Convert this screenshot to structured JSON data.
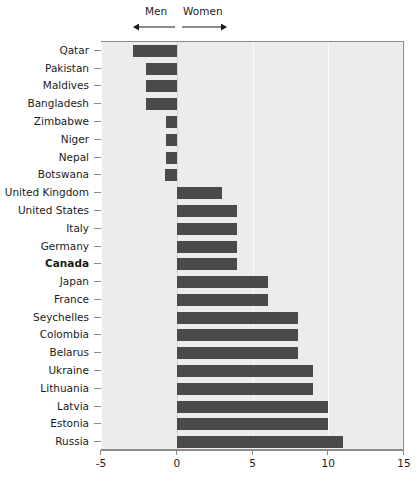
{
  "chart_data": {
    "type": "bar",
    "orientation": "horizontal",
    "title": "",
    "subtitle": "",
    "xlabel": "",
    "ylabel": "",
    "xlim": [
      -5,
      15
    ],
    "xticks": [
      -5,
      0,
      5,
      10,
      15
    ],
    "xtick_labels": [
      "-5",
      "0",
      "5",
      "10",
      "15"
    ],
    "grid": true,
    "grid_axis": "x",
    "legend_position": "top",
    "bar_color": "#4a4a4a",
    "plot_background": "#ececec",
    "highlight_category": "Canada",
    "categories": [
      "Qatar",
      "Pakistan",
      "Maldives",
      "Bangladesh",
      "Zimbabwe",
      "Niger",
      "Nepal",
      "Botswana",
      "United Kingdom",
      "United States",
      "Italy",
      "Germany",
      "Canada",
      "Japan",
      "France",
      "Seychelles",
      "Colombia",
      "Belarus",
      "Ukraine",
      "Lithuania",
      "Latvia",
      "Estonia",
      "Russia"
    ],
    "values": [
      -2.9,
      -2.0,
      -2.0,
      -2.0,
      -0.7,
      -0.7,
      -0.7,
      -0.8,
      3.0,
      4.0,
      4.0,
      4.0,
      4.0,
      6.0,
      6.0,
      8.0,
      8.0,
      8.0,
      9.0,
      9.0,
      10.0,
      10.0,
      11.0
    ],
    "annotations": [
      {
        "name": "men-direction",
        "label": "Men",
        "direction": "left"
      },
      {
        "name": "women-direction",
        "label": "Women",
        "direction": "right"
      }
    ]
  },
  "legend": {
    "men_label": "Men",
    "women_label": "Women"
  }
}
